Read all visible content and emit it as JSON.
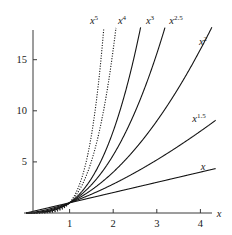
{
  "caption": {
    "text": "Crossover"
  },
  "chart_data": {
    "type": "line",
    "title": "",
    "subtitle": "",
    "xlabel": "x",
    "ylabel": "",
    "grid": false,
    "legend_position": "inline-curve-labels",
    "xlim": [
      0,
      4.35
    ],
    "ylim": [
      0,
      18.2
    ],
    "xticks": [
      1,
      2,
      3,
      4
    ],
    "xticklabels": [
      "1",
      "2",
      "3",
      "4"
    ],
    "yticks": [
      5,
      10,
      15
    ],
    "yticklabels": [
      "5",
      "10",
      "15"
    ],
    "annotations": [
      {
        "text": "x^5",
        "base": "x",
        "exponent": "5",
        "x_px": 94,
        "y_px": 24
      },
      {
        "text": "x^4",
        "base": "x",
        "exponent": "4",
        "x_px": 122,
        "y_px": 24
      },
      {
        "text": "x^3",
        "base": "x",
        "exponent": "3",
        "x_px": 150,
        "y_px": 24
      },
      {
        "text": "x^2.5",
        "base": "x",
        "exponent": "2.5",
        "x_px": 176,
        "y_px": 24
      },
      {
        "text": "x^2",
        "base": "x",
        "exponent": "2",
        "x_px": 203,
        "y_px": 45
      },
      {
        "text": "x^1.5",
        "base": "x",
        "exponent": "1.5",
        "x_px": 199,
        "y_px": 122
      },
      {
        "text": "x",
        "base": "x",
        "exponent": "",
        "x_px": 203,
        "y_px": 170
      }
    ],
    "series": [
      {
        "name": "x^5",
        "exponent": 5,
        "style": "dotted",
        "label": "x^5"
      },
      {
        "name": "x^4",
        "exponent": 4,
        "style": "dotted",
        "label": "x^4"
      },
      {
        "name": "x^3",
        "exponent": 3,
        "style": "solid",
        "label": "x^3"
      },
      {
        "name": "x^2.5",
        "exponent": 2.5,
        "style": "solid",
        "label": "x^2.5"
      },
      {
        "name": "x^2",
        "exponent": 2,
        "style": "solid",
        "label": "x^2"
      },
      {
        "name": "x^1.5",
        "exponent": 1.5,
        "style": "solid",
        "label": "x^1.5"
      },
      {
        "name": "x",
        "exponent": 1,
        "style": "solid",
        "label": "x"
      }
    ],
    "colors": {
      "axis": "#3a3a3a",
      "curve": "#141414",
      "background": "#ffffff"
    },
    "geometry": {
      "x0_px": 26,
      "yaxis_px": 33,
      "baseline_px": 213,
      "x_unit_px": 43.6,
      "y_unit_px": 10.22,
      "top_px": 30
    }
  }
}
